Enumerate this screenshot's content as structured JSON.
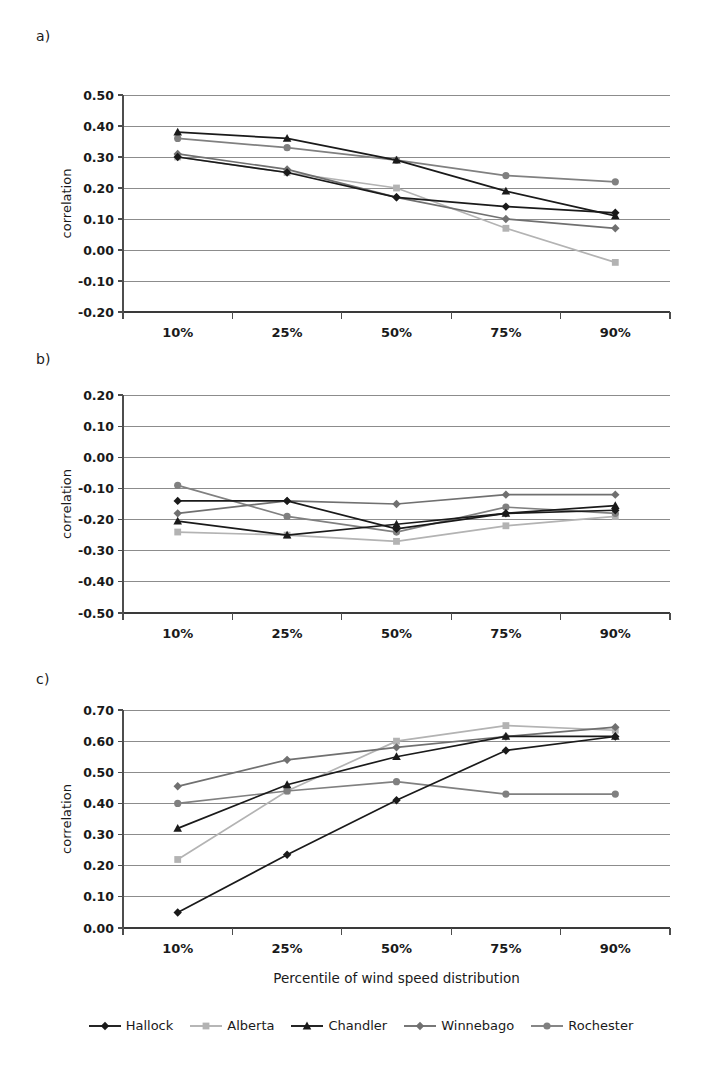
{
  "figure": {
    "panel_labels": [
      "a)",
      "b)",
      "c)"
    ],
    "xaxis_title": "Percentile of wind speed distribution",
    "yaxis_title": "correlation"
  },
  "legend": {
    "items": [
      {
        "label": "Hallock",
        "color": "#1a1a1a",
        "marker": "diamond"
      },
      {
        "label": "Alberta",
        "color": "#b3b3b3",
        "marker": "square"
      },
      {
        "label": "Chandler",
        "color": "#1a1a1a",
        "marker": "triangle"
      },
      {
        "label": "Winnebago",
        "color": "#707070",
        "marker": "diamond"
      },
      {
        "label": "Rochester",
        "color": "#808080",
        "marker": "circle"
      }
    ]
  },
  "chart_data": [
    {
      "panel": "a)",
      "type": "line",
      "title": "",
      "xlabel": "",
      "ylabel": "correlation",
      "categories": [
        "10%",
        "25%",
        "50%",
        "75%",
        "90%"
      ],
      "ylim": [
        -0.2,
        0.5
      ],
      "yticks": [
        "0.50",
        "0.40",
        "0.30",
        "0.20",
        "0.10",
        "0.00",
        "-0.10",
        "-0.20"
      ],
      "ytick_values": [
        0.5,
        0.4,
        0.3,
        0.2,
        0.1,
        0.0,
        -0.1,
        -0.2
      ],
      "grid": true,
      "legend_position": "bottom",
      "series": [
        {
          "name": "Hallock",
          "color": "#1a1a1a",
          "marker": "diamond",
          "values": [
            0.3,
            0.25,
            0.17,
            0.14,
            0.12
          ]
        },
        {
          "name": "Alberta",
          "color": "#b3b3b3",
          "marker": "square",
          "values": [
            0.3,
            0.25,
            0.2,
            0.07,
            -0.04
          ]
        },
        {
          "name": "Chandler",
          "color": "#1a1a1a",
          "marker": "triangle",
          "values": [
            0.38,
            0.36,
            0.29,
            0.19,
            0.11
          ]
        },
        {
          "name": "Winnebago",
          "color": "#707070",
          "marker": "diamond",
          "values": [
            0.31,
            0.26,
            0.17,
            0.1,
            0.07
          ]
        },
        {
          "name": "Rochester",
          "color": "#808080",
          "marker": "circle",
          "values": [
            0.36,
            0.33,
            0.29,
            0.24,
            0.22
          ]
        }
      ]
    },
    {
      "panel": "b)",
      "type": "line",
      "title": "",
      "xlabel": "",
      "ylabel": "correlation",
      "categories": [
        "10%",
        "25%",
        "50%",
        "75%",
        "90%"
      ],
      "ylim": [
        -0.5,
        0.2
      ],
      "yticks": [
        "0.20",
        "0.10",
        "0.00",
        "-0.10",
        "-0.20",
        "-0.30",
        "-0.40",
        "-0.50"
      ],
      "ytick_values": [
        0.2,
        0.1,
        0.0,
        -0.1,
        -0.2,
        -0.3,
        -0.4,
        -0.5
      ],
      "grid": true,
      "legend_position": "bottom",
      "series": [
        {
          "name": "Hallock",
          "color": "#1a1a1a",
          "marker": "diamond",
          "values": [
            -0.14,
            -0.14,
            -0.23,
            -0.18,
            -0.17
          ]
        },
        {
          "name": "Alberta",
          "color": "#b3b3b3",
          "marker": "square",
          "values": [
            -0.24,
            -0.25,
            -0.27,
            -0.22,
            -0.19
          ]
        },
        {
          "name": "Chandler",
          "color": "#1a1a1a",
          "marker": "triangle",
          "values": [
            -0.205,
            -0.25,
            -0.215,
            -0.18,
            -0.155
          ]
        },
        {
          "name": "Winnebago",
          "color": "#707070",
          "marker": "diamond",
          "values": [
            -0.18,
            -0.14,
            -0.15,
            -0.12,
            -0.12
          ]
        },
        {
          "name": "Rochester",
          "color": "#808080",
          "marker": "circle",
          "values": [
            -0.09,
            -0.19,
            -0.24,
            -0.16,
            -0.18
          ]
        }
      ]
    },
    {
      "panel": "c)",
      "type": "line",
      "title": "",
      "xlabel": "Percentile of wind speed distribution",
      "ylabel": "correlation",
      "categories": [
        "10%",
        "25%",
        "50%",
        "75%",
        "90%"
      ],
      "ylim": [
        0.0,
        0.7
      ],
      "yticks": [
        "0.70",
        "0.60",
        "0.50",
        "0.40",
        "0.30",
        "0.20",
        "0.10",
        "0.00"
      ],
      "ytick_values": [
        0.7,
        0.6,
        0.5,
        0.4,
        0.3,
        0.2,
        0.1,
        0.0
      ],
      "grid": true,
      "legend_position": "bottom",
      "series": [
        {
          "name": "Hallock",
          "color": "#1a1a1a",
          "marker": "diamond",
          "values": [
            0.05,
            0.235,
            0.41,
            0.57,
            0.615
          ]
        },
        {
          "name": "Alberta",
          "color": "#b3b3b3",
          "marker": "square",
          "values": [
            0.22,
            0.44,
            0.6,
            0.65,
            0.635
          ]
        },
        {
          "name": "Chandler",
          "color": "#1a1a1a",
          "marker": "triangle",
          "values": [
            0.32,
            0.46,
            0.55,
            0.615,
            0.615
          ]
        },
        {
          "name": "Winnebago",
          "color": "#707070",
          "marker": "diamond",
          "values": [
            0.455,
            0.54,
            0.58,
            0.615,
            0.645
          ]
        },
        {
          "name": "Rochester",
          "color": "#808080",
          "marker": "circle",
          "values": [
            0.4,
            0.44,
            0.47,
            0.43,
            0.43
          ]
        }
      ]
    }
  ]
}
